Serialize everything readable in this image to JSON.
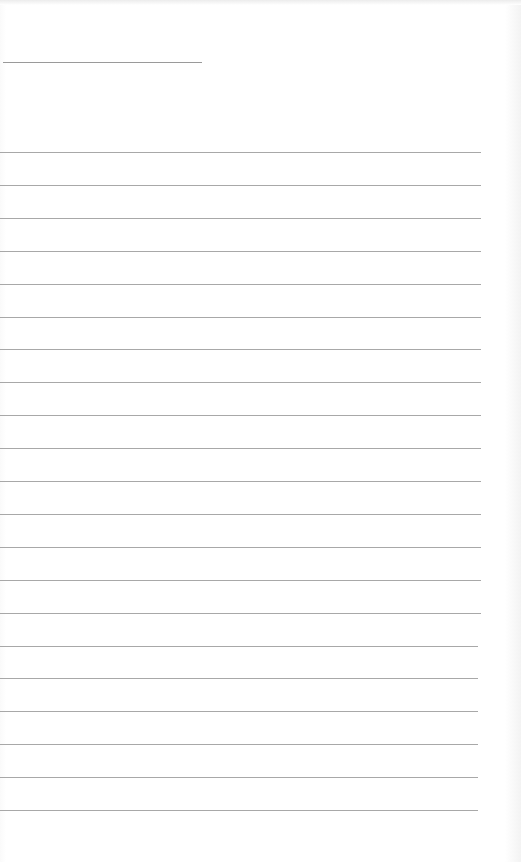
{
  "sheet": {
    "type": "lined-paper",
    "background_color": "#ffffff",
    "line_color": "#a8a8a8",
    "header_line": {
      "x": 3,
      "y": 62,
      "width": 199
    },
    "rules": {
      "count": 21,
      "first_y": 152,
      "spacing": 32.9,
      "x_start": 0,
      "x_end": 481
    }
  }
}
